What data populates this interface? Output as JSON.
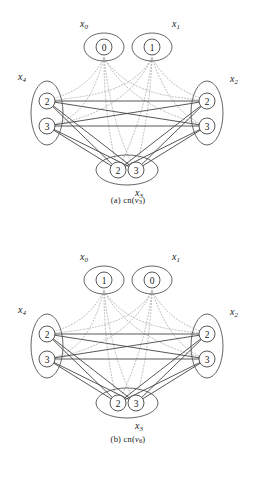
{
  "figures": [
    {
      "id": "figure-a",
      "caption_prefix": "(a)",
      "caption_fn": "cn(",
      "caption_var": "v",
      "caption_sub": "3",
      "caption_close": ")",
      "groups": {
        "x0": {
          "label": "x",
          "sub": "0",
          "nodes": [
            "0"
          ]
        },
        "x1": {
          "label": "x",
          "sub": "1",
          "nodes": [
            "1"
          ]
        },
        "x4": {
          "label": "x",
          "sub": "4",
          "nodes": [
            "2",
            "3"
          ]
        },
        "x2": {
          "label": "x",
          "sub": "2",
          "nodes": [
            "2",
            "3"
          ]
        },
        "x3": {
          "label": "x",
          "sub": "3",
          "nodes": [
            "2",
            "3"
          ]
        }
      }
    },
    {
      "id": "figure-b",
      "caption_prefix": "(b)",
      "caption_fn": "cn(",
      "caption_var": "v",
      "caption_sub": "6",
      "caption_close": ")",
      "groups": {
        "x0": {
          "label": "x",
          "sub": "0",
          "nodes": [
            "1"
          ]
        },
        "x1": {
          "label": "x",
          "sub": "1",
          "nodes": [
            "0"
          ]
        },
        "x4": {
          "label": "x",
          "sub": "4",
          "nodes": [
            "2",
            "3"
          ]
        },
        "x2": {
          "label": "x",
          "sub": "2",
          "nodes": [
            "2",
            "3"
          ]
        },
        "x3": {
          "label": "x",
          "sub": "3",
          "nodes": [
            "2",
            "3"
          ]
        }
      }
    }
  ],
  "style": {
    "solid_edge_color": "#3a3a3a",
    "dotted_edge_color": "#b0b0b0",
    "ellipse_color": "#4a4a4a",
    "node_color": "#3a3a3a",
    "text_color": "#1a1a1a"
  }
}
